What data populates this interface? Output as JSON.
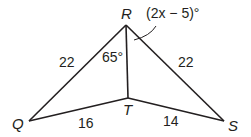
{
  "figure": {
    "type": "geometry-diagram",
    "vertices": {
      "R": {
        "label": "R",
        "x": 126,
        "y": 25
      },
      "T": {
        "label": "T",
        "x": 128,
        "y": 98
      },
      "Q": {
        "label": "Q",
        "x": 29,
        "y": 121
      },
      "S": {
        "label": "S",
        "x": 224,
        "y": 121
      }
    },
    "segments": {
      "QR": {
        "label": "22"
      },
      "RS": {
        "label": "22"
      },
      "QT": {
        "label": "16"
      },
      "TS": {
        "label": "14"
      },
      "RT": {
        "label": ""
      }
    },
    "angles": {
      "QRT": {
        "label": "65°"
      },
      "TRS": {
        "label": "(2x − 5)°"
      }
    },
    "colors": {
      "stroke": "#231f20",
      "background": "#ffffff"
    }
  }
}
